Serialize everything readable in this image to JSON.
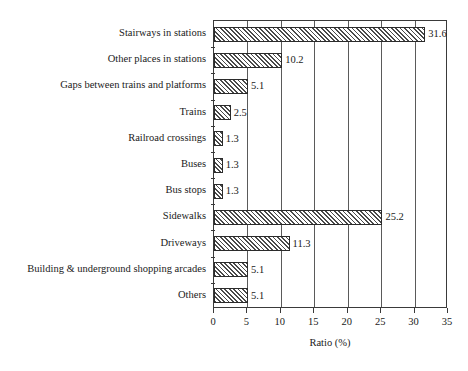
{
  "chart_data": {
    "type": "bar",
    "orientation": "horizontal",
    "title": "",
    "xlabel": "Ratio (%)",
    "ylabel": "",
    "xlim": [
      0,
      35
    ],
    "xticks": [
      0,
      5,
      10,
      15,
      20,
      25,
      30,
      35
    ],
    "xtick_labels": [
      "0",
      "5",
      "10",
      "15",
      "20",
      "25",
      "30",
      "35"
    ],
    "grid": true,
    "grid_axis": "x",
    "legend": false,
    "categories": [
      "Stairways in stations",
      "Other places in stations",
      "Gaps between trains and platforms",
      "Trains",
      "Railroad crossings",
      "Buses",
      "Bus stops",
      "Sidewalks",
      "Driveways",
      "Building & underground shopping arcades",
      "Others"
    ],
    "values": [
      31.6,
      10.2,
      5.1,
      2.5,
      1.3,
      1.3,
      1.3,
      25.2,
      11.3,
      5.1,
      5.1
    ],
    "value_labels": [
      "31.6",
      "10.2",
      "5.1",
      "2.5",
      "1.3",
      "1.3",
      "1.3",
      "25.2",
      "11.3",
      "5.1",
      "5.1"
    ],
    "bar_fill": "hatched-diagonal",
    "bar_edge_color": "#2b2b2b",
    "bar_hatch_color": "#4a4a4a",
    "frame_color": "#3a3a3a",
    "background": "#ffffff"
  }
}
